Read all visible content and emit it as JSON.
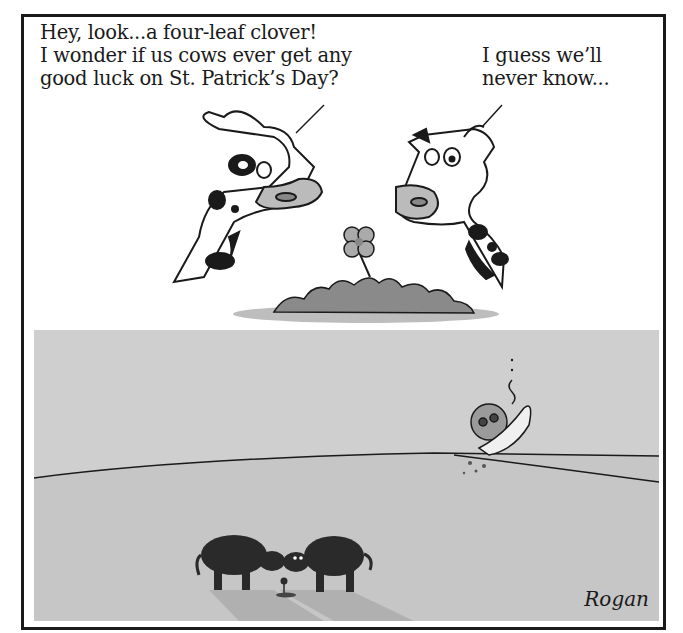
{
  "comic": {
    "panel_top": {
      "caption_left": "Hey, look...a four-leaf clover!\nI wonder if us cows ever get any\ngood luck on St. Patrick’s Day?",
      "caption_right": "I guess we’ll\nnever know...",
      "elements": [
        "cow-left-head",
        "cow-right-head",
        "four-leaf-clover",
        "clover-patch"
      ]
    },
    "panel_bottom": {
      "elements": [
        "crashed-ufo",
        "smoke",
        "cow-silhouette-left",
        "cow-silhouette-right",
        "small-clover",
        "cow-shadows",
        "horizon"
      ],
      "signature": "Rogan"
    },
    "colors": {
      "ink": "#1a1a1a",
      "sky": "#cfcfcf",
      "ground": "#c4c4c4",
      "patch": "#9a9a9a",
      "paper": "#ffffff"
    }
  }
}
